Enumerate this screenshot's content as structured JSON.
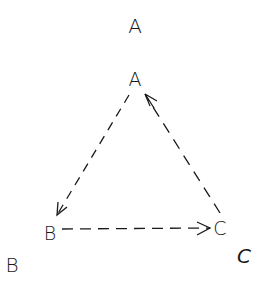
{
  "diagram": {
    "outer_labels": {
      "a": "A",
      "b": "B",
      "c": "C"
    },
    "inner_labels": {
      "a": "A",
      "b": "B",
      "c": "C"
    },
    "edges": [
      {
        "from": "A",
        "to": "B",
        "style": "dashed",
        "arrowhead": "at B"
      },
      {
        "from": "B",
        "to": "C",
        "style": "dashed",
        "arrowhead": "at C"
      },
      {
        "from": "C",
        "to": "A",
        "style": "dashed",
        "arrowhead": "at A"
      }
    ],
    "caption": "",
    "colors": {
      "stroke": "#1a1a1a",
      "background": "#ffffff"
    }
  }
}
